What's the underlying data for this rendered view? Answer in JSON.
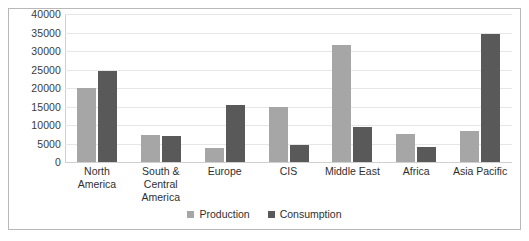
{
  "chart_data": {
    "type": "bar",
    "title": "",
    "subtitle": "",
    "xlabel": "",
    "ylabel": "",
    "ylim": [
      0,
      40000
    ],
    "ytick_step": 5000,
    "yticks": [
      "40000",
      "35000",
      "30000",
      "25000",
      "20000",
      "15000",
      "10000",
      "5000",
      "0"
    ],
    "grid": true,
    "legend_position": "bottom-center",
    "categories": [
      "North America",
      "South & Central America",
      "Europe",
      "CIS",
      "Middle East",
      "Africa",
      "Asia Pacific"
    ],
    "series": [
      {
        "name": "Production",
        "color": "#a6a6a6",
        "values": [
          20000,
          7200,
          3800,
          15000,
          31500,
          7500,
          8500
        ]
      },
      {
        "name": "Consumption",
        "color": "#595959",
        "values": [
          24500,
          7000,
          15500,
          4500,
          9500,
          4000,
          34500
        ]
      }
    ]
  },
  "legend": {
    "items": [
      {
        "label": "Production",
        "swatch": "production"
      },
      {
        "label": "Consumption",
        "swatch": "consumption"
      }
    ]
  },
  "colors": {
    "production": "#a6a6a6",
    "consumption": "#595959",
    "gridline": "#e6e6e6",
    "border": "#b8b8b8",
    "text": "#2f2f2f"
  }
}
